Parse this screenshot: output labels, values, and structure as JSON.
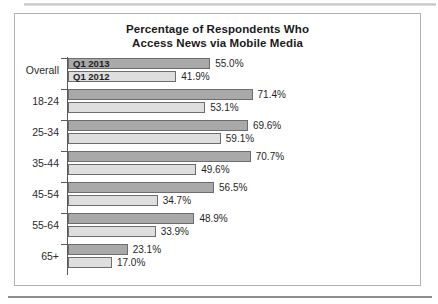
{
  "chart_data": {
    "type": "bar",
    "orientation": "horizontal",
    "title": "Percentage of Respondents Who Access News via Mobile Media",
    "title_lines": [
      "Percentage of Respondents Who",
      "Access News via Mobile Media"
    ],
    "xlabel": "",
    "ylabel": "",
    "categories": [
      "Overall",
      "18-24",
      "25-34",
      "35-44",
      "45-54",
      "55-64",
      "65+"
    ],
    "series": [
      {
        "name": "Q1 2013",
        "color": "#a9a9a9",
        "values": [
          55.0,
          71.4,
          69.6,
          70.7,
          56.5,
          48.9,
          23.1
        ],
        "labels": [
          "55.0%",
          "71.4%",
          "69.6%",
          "70.7%",
          "56.5%",
          "48.9%",
          "23.1%"
        ]
      },
      {
        "name": "Q1 2012",
        "color": "#dedede",
        "values": [
          41.9,
          53.1,
          59.1,
          49.6,
          34.7,
          33.9,
          17.0
        ],
        "labels": [
          "41.9%",
          "53.1%",
          "59.1%",
          "49.6%",
          "34.7%",
          "33.9%",
          "17.0%"
        ]
      }
    ],
    "legend": {
      "position": "inside-first-group",
      "entries": [
        "Q1 2013",
        "Q1 2012"
      ]
    },
    "xlim": [
      0,
      80
    ],
    "grid": false,
    "value_suffix": "%"
  }
}
